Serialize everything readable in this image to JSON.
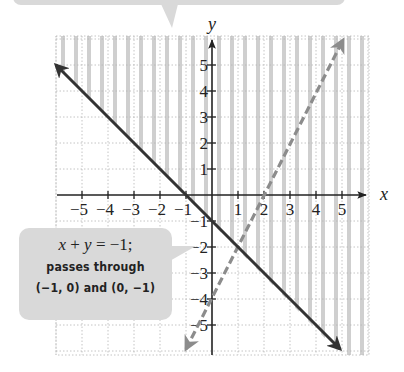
{
  "chart_data": {
    "type": "line",
    "title": "",
    "xlabel": "x",
    "ylabel": "y",
    "xlim": [
      -6,
      6
    ],
    "ylim": [
      -6,
      6
    ],
    "grid": true,
    "x_ticks": [
      -5,
      -4,
      -3,
      -2,
      -1,
      1,
      2,
      3,
      4,
      5
    ],
    "y_ticks": [
      -5,
      -4,
      -3,
      -2,
      -1,
      1,
      2,
      3,
      4,
      5
    ],
    "series": [
      {
        "name": "x + y = -1",
        "style": "solid",
        "color": "#333333",
        "x": [
          -6,
          5
        ],
        "y": [
          5,
          -6
        ],
        "arrows": "both"
      },
      {
        "name": "y = 2x - 4",
        "style": "dashed",
        "color": "#8c8c8c",
        "x": [
          -1,
          5
        ],
        "y": [
          -6,
          6
        ],
        "arrows": "both"
      }
    ],
    "shaded_region": {
      "description": "vertical stripes above the solid line (x + y > -1)",
      "pattern": "vertical-stripes",
      "color": "#cfcfcf"
    },
    "annotations": [
      {
        "text_equation": "x + y = −1;",
        "text_line2": "passes through",
        "text_line3": "(−1, 0) and (0, −1)",
        "points_to": [
          -0.6,
          -1.9
        ]
      }
    ]
  },
  "labels": {
    "x_axis": "x",
    "y_axis": "y",
    "x_ticks": [
      "−5",
      "−4",
      "−3",
      "−2",
      "−1",
      "1",
      "2",
      "3",
      "4",
      "5"
    ],
    "y_ticks": [
      "5",
      "4",
      "3",
      "2",
      "1",
      "−1",
      "−2",
      "−3",
      "−4",
      "−5"
    ]
  },
  "callout": {
    "eq_x": "x",
    "eq_plus": " + ",
    "eq_y": "y",
    "eq_rest": " = −1;",
    "line2": "passes through",
    "line3": "(−1, 0) and (0, −1)"
  },
  "colors": {
    "solid_line": "#333333",
    "dashed_line": "#8c8c8c",
    "stripe": "#cfcfcf",
    "grid": "#b5b5b5",
    "callout_bg": "#d9d9d9"
  }
}
